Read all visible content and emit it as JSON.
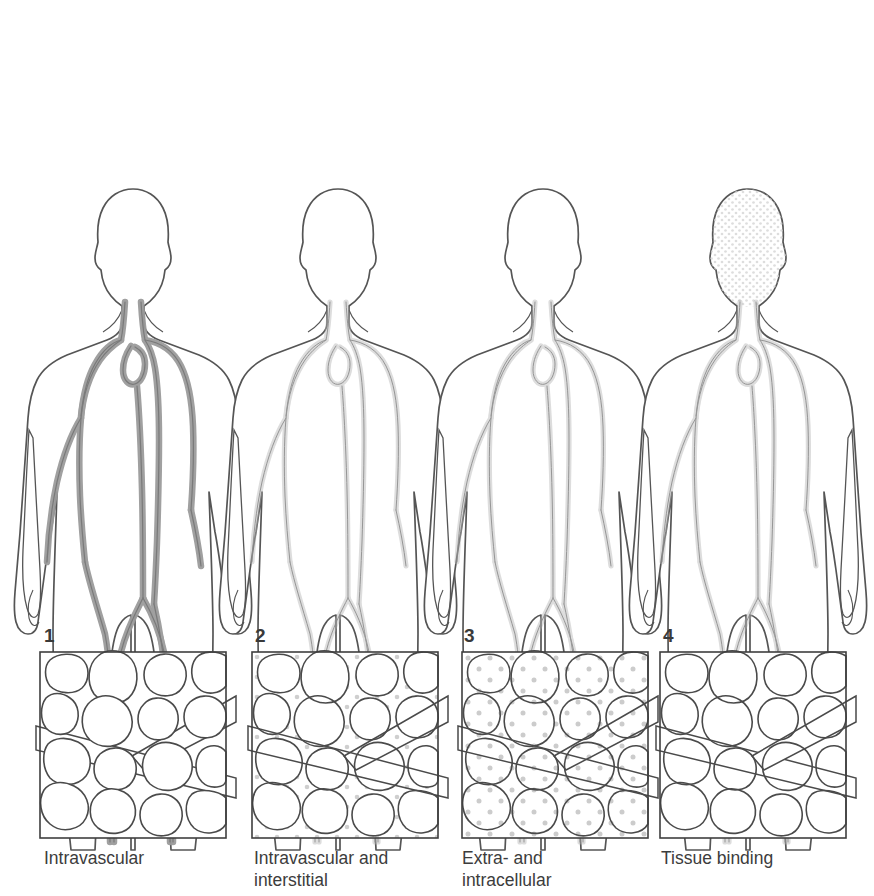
{
  "figure": {
    "background_color": "#ffffff",
    "outline_color": "#555555",
    "vessel_color": "#8d8d8d",
    "dot_color": "#c9c9c9",
    "text_color": "#3c3c3c"
  },
  "panels": [
    {
      "number": "1",
      "caption": "Intravascular",
      "body_label": "body-figure-1",
      "tissue_label": "tissue-panel-1",
      "distribution": "vessels only",
      "dots_in_vessels": true,
      "dots_in_interstitium": false,
      "dots_in_cells": false,
      "body_vessels_highlighted": true,
      "body_head_stippled": false
    },
    {
      "number": "2",
      "caption": "Intravascular and\ninterstitial",
      "body_label": "body-figure-2",
      "tissue_label": "tissue-panel-2",
      "distribution": "vessels and interstitial space",
      "dots_in_vessels": true,
      "dots_in_interstitium": true,
      "dots_in_cells": false,
      "body_vessels_highlighted": false,
      "body_head_stippled": false
    },
    {
      "number": "3",
      "caption": "Extra- and\nintracellular",
      "body_label": "body-figure-3",
      "tissue_label": "tissue-panel-3",
      "distribution": "uniform throughout extracellular and intracellular space",
      "dots_in_vessels": true,
      "dots_in_interstitium": true,
      "dots_in_cells": true,
      "body_vessels_highlighted": false,
      "body_head_stippled": false
    },
    {
      "number": "4",
      "caption": "Tissue binding",
      "body_label": "body-figure-4",
      "tissue_label": "tissue-panel-4",
      "distribution": "concentrated inside cells (bound to tissue)",
      "dots_in_vessels": false,
      "dots_in_interstitium": false,
      "dots_in_cells": true,
      "body_vessels_highlighted": false,
      "body_head_stippled": true
    }
  ]
}
